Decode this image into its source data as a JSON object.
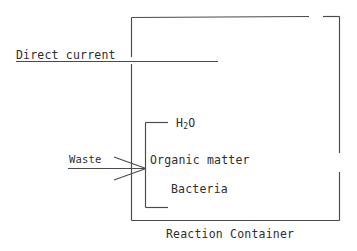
{
  "diagram": {
    "title": "Reaction Container",
    "caption": "Reaction Container",
    "stroke_color": "#4a4a4e",
    "text_color": "#2e2e30",
    "background_color": "#ffffff",
    "labels": {
      "direct_current": "Direct current",
      "waste": "Waste",
      "water_formula_base": "H",
      "water_formula_subscript": "2",
      "water_formula_tail": "O",
      "organic_matter": "Organic matter",
      "bacteria": "Bacteria"
    },
    "contents": [
      "H2O",
      "Organic matter",
      "Bacteria"
    ],
    "inputs": [
      "Direct current",
      "Waste"
    ]
  }
}
